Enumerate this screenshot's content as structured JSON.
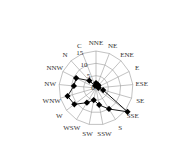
{
  "chart_data": {
    "type": "radar",
    "title": "",
    "categories": [
      "NNE",
      "NE",
      "ENE",
      "E",
      "ESE",
      "SE",
      "SSE",
      "S",
      "SSW",
      "SW",
      "WSW",
      "W",
      "WNW",
      "NW",
      "NNW",
      "N",
      "C"
    ],
    "values": [
      2,
      1.5,
      1.5,
      1,
      1,
      3,
      16,
      10,
      7,
      5,
      7,
      11,
      12,
      9,
      9,
      4,
      1
    ],
    "radial_ticks": [
      "0",
      "5",
      "10",
      "15"
    ],
    "rmax": 15,
    "grid": true,
    "colors": {
      "line": "#000000",
      "grid": "#999999"
    }
  }
}
